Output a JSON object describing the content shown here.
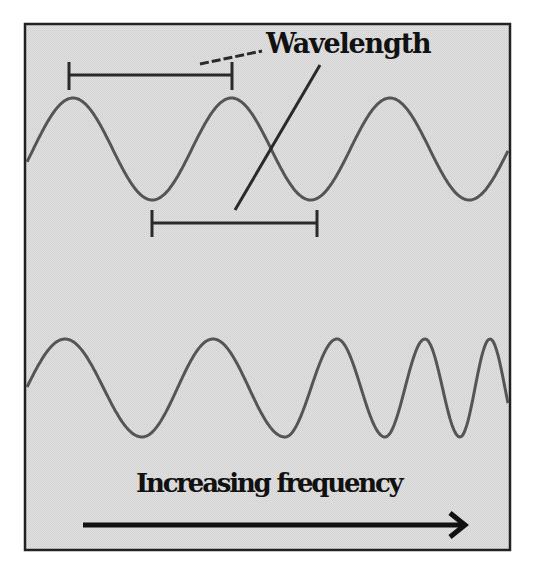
{
  "diagram": {
    "labels": {
      "wavelength": "Wavelength",
      "increasing_frequency": "Increasing frequency"
    },
    "colors": {
      "page_background": "#ffffff",
      "panel_background": "#dcdcdc",
      "panel_dither": "#cfcfcf",
      "frame_border": "#222222",
      "wave_stroke": "#555555",
      "annotation_stroke": "#2a2a2a",
      "arrow_stroke": "#111111",
      "text": "#111111"
    },
    "frame": {
      "x": 25,
      "y": 24,
      "width": 485,
      "height": 526
    }
  },
  "chart_data": {
    "type": "diagram",
    "title": "",
    "annotations": [
      {
        "text": "Wavelength",
        "kind": "label",
        "points_to": [
          "top-bracket",
          "bottom-bracket"
        ]
      },
      {
        "text": "Increasing frequency",
        "kind": "label",
        "with_arrow": "left-to-right"
      }
    ],
    "waves": [
      {
        "name": "constant-wavelength wave",
        "x_start": 27,
        "x_end": 508,
        "center_y": 149,
        "amplitude": 51,
        "period_px": 158.5,
        "first_peak_x": 73,
        "peaks_x": [
          73,
          232,
          390
        ],
        "troughs_x": [
          153,
          311,
          467
        ]
      },
      {
        "name": "increasing-frequency wave",
        "x_start": 27,
        "x_end": 508,
        "center_y": 388,
        "amplitude": 49,
        "peaks_x": [
          65,
          213,
          337,
          425,
          490
        ],
        "troughs_x": [
          142,
          285,
          385,
          460
        ]
      }
    ],
    "brackets": [
      {
        "name": "top-bracket",
        "x1": 69,
        "x2": 232,
        "y": 75,
        "tick_top": 62,
        "tick_bottom": 90,
        "spans": "peak to peak"
      },
      {
        "name": "bottom-bracket",
        "x1": 152,
        "x2": 317,
        "y": 223,
        "tick_top": 210,
        "tick_bottom": 237,
        "spans": "trough to trough"
      }
    ],
    "leaders": [
      {
        "name": "wavelength-leader-dashed",
        "from": [
          200,
          64
        ],
        "to": [
          262,
          51
        ]
      },
      {
        "name": "wavelength-leader-diagonal",
        "from": [
          320,
          65
        ],
        "to": [
          235,
          210
        ]
      }
    ],
    "arrow": {
      "x1": 83,
      "x2": 465,
      "y": 525,
      "direction": "right"
    }
  }
}
